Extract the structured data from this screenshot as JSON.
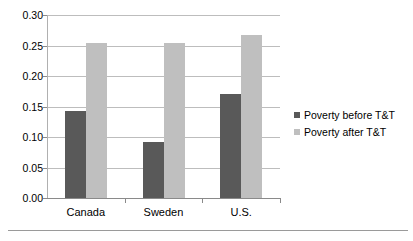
{
  "chart_data": {
    "type": "bar",
    "title": "",
    "xlabel": "",
    "ylabel": "",
    "categories": [
      "Canada",
      "Sweden",
      "U.S."
    ],
    "series": [
      {
        "name": "Poverty before T&T",
        "color": "#595959",
        "values": [
          0.142,
          0.092,
          0.17
        ]
      },
      {
        "name": "Poverty after T&T",
        "color": "#bfbfbf",
        "values": [
          0.254,
          0.254,
          0.268
        ]
      }
    ],
    "ylim": [
      0.0,
      0.3
    ],
    "ytick_labels": [
      "0.00",
      "0.05",
      "0.10",
      "0.15",
      "0.20",
      "0.25",
      "0.30"
    ],
    "ytick_values": [
      0.0,
      0.05,
      0.1,
      0.15,
      0.2,
      0.25,
      0.3
    ],
    "grid": true,
    "legend_position": "right"
  }
}
